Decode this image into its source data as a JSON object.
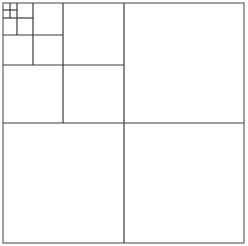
{
  "diagram": {
    "type": "recursive-square-subdivision",
    "line_color": "#3a3a3a",
    "outer_line_color": "#6e6e6e",
    "background": "#ffffff",
    "outer": {
      "x0": 3,
      "y0": 3,
      "x1": 244,
      "y1": 243
    },
    "levels": [
      {
        "level": 1,
        "split_x": 124,
        "split_y": 123,
        "x_end": 244,
        "y_end": 243
      },
      {
        "level": 2,
        "split_x": 63,
        "split_y": 65,
        "x_end": 124,
        "y_end": 123
      },
      {
        "level": 3,
        "split_x": 33,
        "split_y": 35,
        "x_end": 63,
        "y_end": 65
      },
      {
        "level": 4,
        "split_x": 17,
        "split_y": 18,
        "x_end": 33,
        "y_end": 35
      },
      {
        "level": 5,
        "split_x": 10,
        "split_y": 10,
        "x_end": 17,
        "y_end": 18
      }
    ]
  }
}
